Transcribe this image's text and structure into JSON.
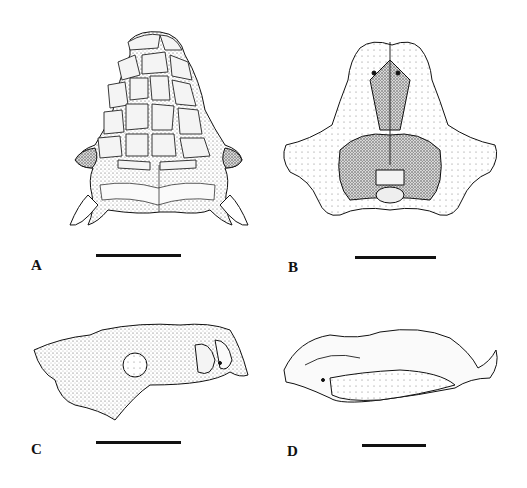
{
  "figure": {
    "panels": [
      {
        "id": "A",
        "label": "A",
        "view": "skull dorsal view",
        "scale_bar": {
          "x1": 96,
          "x2": 181,
          "y": 254
        }
      },
      {
        "id": "B",
        "label": "B",
        "view": "skull ventral view",
        "scale_bar": {
          "x1": 355,
          "x2": 436,
          "y": 256
        }
      },
      {
        "id": "C",
        "label": "C",
        "view": "skull lateral view",
        "scale_bar": {
          "x1": 96,
          "x2": 181,
          "y": 441
        }
      },
      {
        "id": "D",
        "label": "D",
        "view": "mandible lateral view",
        "scale_bar": {
          "x1": 362,
          "x2": 426,
          "y": 444
        }
      }
    ],
    "colors": {
      "ink": "#111111",
      "background": "#ffffff",
      "stipple": "#bdbdbd",
      "shade": "#8a8a8a"
    }
  }
}
